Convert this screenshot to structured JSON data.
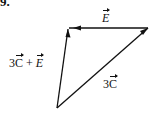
{
  "problem": {
    "number": "9."
  },
  "vectors": {
    "top": {
      "symbol": "E",
      "label": "E"
    },
    "diagonal": {
      "coefficient": "3",
      "symbol": "C"
    },
    "left": {
      "coefficient": "3",
      "symbol1": "C",
      "operator": " + ",
      "symbol2": "E"
    }
  },
  "geometry": {
    "vertices": {
      "top_left": [
        68,
        28
      ],
      "top_right": [
        148,
        28
      ],
      "bottom": [
        57,
        108
      ]
    }
  },
  "colors": {
    "stroke": "#111111",
    "background": "#ffffff"
  }
}
